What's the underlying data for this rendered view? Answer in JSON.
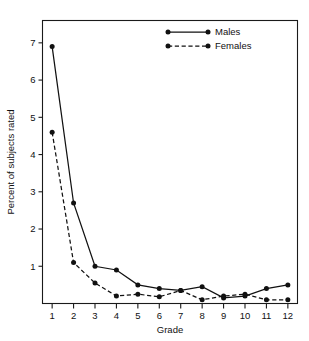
{
  "chart_data": {
    "type": "line",
    "title": "",
    "xlabel": "Grade",
    "ylabel": "Percent of subjects rated",
    "x": [
      1,
      2,
      3,
      4,
      5,
      6,
      7,
      8,
      9,
      10,
      11,
      12
    ],
    "categories": [
      "1",
      "2",
      "3",
      "4",
      "5",
      "6",
      "7",
      "8",
      "9",
      "10",
      "11",
      "12"
    ],
    "xtick_labels": [
      "1",
      "2",
      "3",
      "4",
      "5",
      "6",
      "7",
      "8",
      "9",
      "10",
      "11",
      "12"
    ],
    "ytick_labels": [
      "1",
      "2",
      "3",
      "4",
      "5",
      "6",
      "7"
    ],
    "yticks": [
      1,
      2,
      3,
      4,
      5,
      6,
      7
    ],
    "xlim": [
      0.55,
      12.45
    ],
    "ylim": [
      0,
      7.6
    ],
    "grid": false,
    "legend_position": "top-center",
    "series": [
      {
        "name": "Males",
        "style": "solid",
        "marker": "filled-circle",
        "color": "#111111",
        "values": [
          6.9,
          2.7,
          1.0,
          0.9,
          0.5,
          0.4,
          0.35,
          0.45,
          0.15,
          0.2,
          0.4,
          0.5
        ]
      },
      {
        "name": "Females",
        "style": "dashed",
        "marker": "filled-circle",
        "color": "#111111",
        "values": [
          4.6,
          1.1,
          0.55,
          0.2,
          0.25,
          0.18,
          0.35,
          0.1,
          0.2,
          0.25,
          0.1,
          0.1
        ]
      }
    ]
  },
  "legend": {
    "entries": [
      {
        "label": "Males"
      },
      {
        "label": "Females"
      }
    ]
  },
  "axes": {
    "x_title": "Grade",
    "y_title": "Percent of subjects rated"
  }
}
